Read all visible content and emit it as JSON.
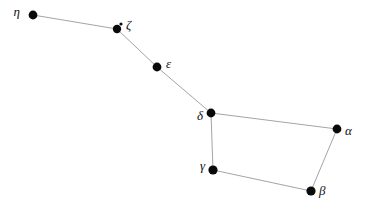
{
  "chart_data": {
    "type": "scatter",
    "title": "",
    "subtitle": "",
    "xlabel": "",
    "ylabel": "",
    "grid": false,
    "legend": false,
    "xlim": [
      0,
      369
    ],
    "ylim": [
      200,
      0
    ],
    "background_color": "#ffffff",
    "line_color": "#9a9a9a",
    "star_color": "#0a0a0a",
    "label_color": "#111111",
    "points": [
      {
        "label": "η",
        "x": 33,
        "y": 15,
        "r": 4.4,
        "label_x": 20,
        "label_y": 13,
        "label_anchor": "end"
      },
      {
        "label": "ζ",
        "x": 117,
        "y": 29,
        "r": 4.2,
        "label_x": 126,
        "label_y": 26,
        "label_anchor": "start"
      },
      {
        "label": "ε",
        "x": 157,
        "y": 67,
        "r": 4.4,
        "label_x": 166,
        "label_y": 65,
        "label_anchor": "start"
      },
      {
        "label": "δ",
        "x": 211,
        "y": 113,
        "r": 4.4,
        "label_x": 203,
        "label_y": 117,
        "label_anchor": "end"
      },
      {
        "label": "α",
        "x": 337,
        "y": 129,
        "r": 4.4,
        "label_x": 345,
        "label_y": 132,
        "label_anchor": "start"
      },
      {
        "label": "γ",
        "x": 213,
        "y": 170,
        "r": 4.6,
        "label_x": 205,
        "label_y": 167,
        "label_anchor": "end"
      },
      {
        "label": "β",
        "x": 311,
        "y": 191,
        "r": 4.6,
        "label_x": 319,
        "label_y": 192,
        "label_anchor": "start"
      }
    ],
    "companion_points": [
      {
        "label": "",
        "x": 121,
        "y": 24,
        "r": 1.6
      }
    ],
    "edges": [
      {
        "from": "η",
        "to": "ζ"
      },
      {
        "from": "ζ",
        "to": "ε"
      },
      {
        "from": "ε",
        "to": "δ"
      },
      {
        "from": "δ",
        "to": "α"
      },
      {
        "from": "α",
        "to": "β"
      },
      {
        "from": "β",
        "to": "γ"
      },
      {
        "from": "γ",
        "to": "δ"
      }
    ]
  }
}
